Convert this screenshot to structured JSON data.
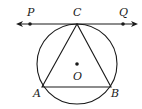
{
  "diagram": {
    "type": "geometry",
    "labels": {
      "P": "P",
      "C": "C",
      "Q": "Q",
      "O": "O",
      "A": "A",
      "B": "B"
    },
    "points": {
      "P": [
        30,
        24
      ],
      "C": [
        77,
        24
      ],
      "Q": [
        123,
        24
      ],
      "O": [
        77,
        64
      ],
      "A": [
        42,
        87
      ],
      "B": [
        111,
        87
      ]
    },
    "circle": {
      "center": [
        77,
        64
      ],
      "radius": 40
    },
    "tangent_line": {
      "from": [
        16,
        24
      ],
      "to": [
        138,
        24
      ],
      "arrows": "both"
    },
    "stroke_color": "#1a1a1a"
  }
}
